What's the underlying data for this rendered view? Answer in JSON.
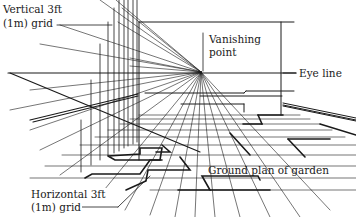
{
  "diagram": {
    "labels": {
      "vertical_grid_line1": "Vertical 3ft",
      "vertical_grid_line2": "(1m) grid",
      "vanishing_point_line1": "Vanishing",
      "vanishing_point_line2": "point",
      "eye_line": "Eye line",
      "ground_plan": "Ground plan of garden",
      "horizontal_grid_line1": "Horizontal 3ft",
      "horizontal_grid_line2": "(1m) grid"
    },
    "colors": {
      "line": "#1a1a1a",
      "background": "#ffffff"
    },
    "vanishing_point": {
      "x": 201,
      "y": 71
    },
    "eye_line_y": 71
  }
}
